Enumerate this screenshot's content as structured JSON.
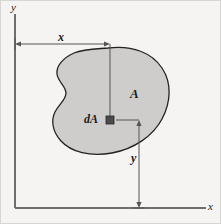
{
  "figure": {
    "kind": "engineering-diagram",
    "background_color": "#f5f4f2",
    "region_fill_color": "#cfcdcb",
    "region_stroke_color": "#222222",
    "axis_color": "#6e6e6e",
    "dimension_color": "#555555",
    "element_color": "#4a4a4a",
    "label_color": "#1a1a1a"
  },
  "axes": {
    "y_axis_label": "y",
    "x_axis_label": "x",
    "origin_x": 15,
    "origin_y": 208,
    "y_axis_top": 14,
    "x_axis_right": 206
  },
  "dimensions": [
    {
      "name": "horizontal-distance",
      "label": "x",
      "orientation": "horizontal",
      "from_x": 15,
      "to_x": 110,
      "y": 44,
      "label_x": 60,
      "label_y": 36
    },
    {
      "name": "vertical-distance",
      "label": "y",
      "orientation": "vertical",
      "from_y": 120,
      "to_y": 208,
      "x": 139,
      "label_x": 133,
      "label_y": 158
    }
  ],
  "annotations": [
    {
      "name": "area-label",
      "label": "A",
      "x": 131,
      "y": 88
    },
    {
      "name": "differential-element-label",
      "label": "dA",
      "x": 88,
      "y": 115
    }
  ],
  "element": {
    "name": "differential-area-element",
    "center_x": 110,
    "center_y": 120,
    "size": 8
  }
}
